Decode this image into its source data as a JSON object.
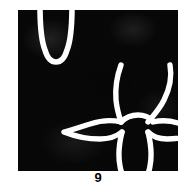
{
  "figure": {
    "caption_number": "9",
    "plate": {
      "background_color": "#080808",
      "line_color": "#ffffff",
      "texture": "halftone-screen",
      "width_px": 160,
      "height_px": 161
    },
    "subjects": [
      {
        "id": "antelope-head-partial",
        "name": "antelope-head-outline-cropped",
        "description": "Partial antelope head outline, cropped by the top edge of the plate, showing only the tapering muzzle and the lower face.",
        "position": "top-left",
        "stroke_color": "#ffffff"
      },
      {
        "id": "antelope-head-full",
        "name": "antelope-head-outline-full",
        "description": "Complete antelope (gazelle) head outline shown frontally with two long lyre-shaped horns, two outward-pointing ears and a tapering muzzle.",
        "position": "bottom-right",
        "stroke_color": "#ffffff"
      }
    ]
  }
}
